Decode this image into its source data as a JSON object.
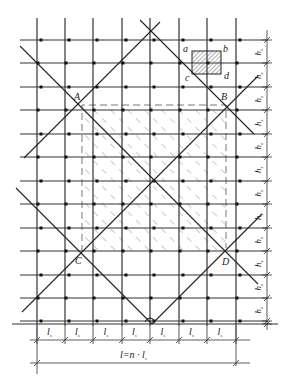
{
  "diagram": {
    "type": "grid-layout-with-diagonal-lines",
    "colors": {
      "line": "#222222",
      "grid": "#333333",
      "hatch": "#777777",
      "point": "#111111",
      "background": "#ffffff"
    },
    "grid": {
      "vertical_x": [
        37,
        65,
        93,
        122,
        150,
        179,
        207,
        236
      ],
      "horizontal_y": [
        40,
        63,
        87,
        110,
        134,
        157,
        181,
        204,
        228,
        251,
        275,
        298,
        321
      ],
      "x_left": 20,
      "x_right": 268,
      "y_top": 18,
      "y_bottom": 326
    },
    "points": {
      "A": {
        "label": "A",
        "x": 80,
        "y": 107,
        "label_x": 72,
        "label_y": 100
      },
      "B": {
        "label": "B",
        "x": 228,
        "y": 106,
        "label_x": 221,
        "label_y": 100
      },
      "C": {
        "label": "C",
        "x": 81,
        "y": 252,
        "label_x": 75,
        "label_y": 263
      },
      "D": {
        "label": "D",
        "x": 227,
        "y": 251,
        "label_x": 222,
        "label_y": 264
      }
    },
    "small_square": {
      "corners": [
        "a",
        "b",
        "c",
        "d"
      ],
      "x": 192,
      "y": 51,
      "w": 29,
      "h": 23
    },
    "dimensions": {
      "row_label": "h",
      "row_sub": "s",
      "column_label": "l",
      "column_sub": "s",
      "column_count": 7,
      "row_count": 12,
      "total_label": "l=n · l",
      "total_sub": "s"
    }
  }
}
